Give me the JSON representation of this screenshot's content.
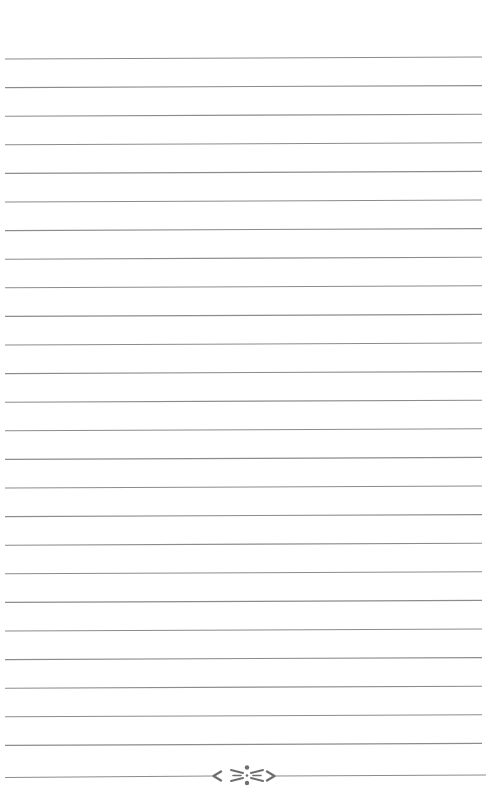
{
  "page": {
    "type": "lined notebook page",
    "background_color": "#ffffff",
    "line_color": "#8c8c8c",
    "ornament_color": "#6f6f6f",
    "line_count": 25,
    "line_spacing_px": 28.6,
    "first_line_y": 59,
    "line_left_x": 5,
    "line_right_x": 482,
    "line_tilt_px": 2
  },
  "footer_ornament": {
    "name": "flourish-divider",
    "center_x": 247,
    "y": 776,
    "left_line_end_x": 213,
    "right_line_start_x": 275
  }
}
